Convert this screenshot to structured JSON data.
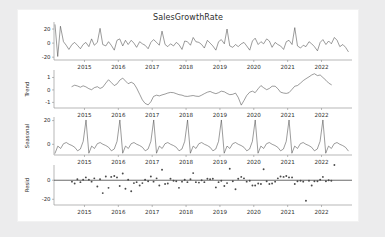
{
  "figure": {
    "title": "SalesGrowthRate",
    "background": "#ffffff",
    "page_background": "#ececed",
    "line_color": "#4a4a4a",
    "axis_color": "#9a9a9a"
  },
  "chart_data": {
    "type": "line",
    "title": "SalesGrowthRate",
    "xlabel": "",
    "x_ticklabels": [
      "2015",
      "2016",
      "2017",
      "2018",
      "2019",
      "2020",
      "2021",
      "2022"
    ],
    "x_tickvalues": [
      2015,
      2016,
      2017,
      2018,
      2019,
      2020,
      2021,
      2022
    ],
    "xlim": [
      2014.1,
      2022.9
    ],
    "grid": false,
    "legend": "none",
    "panels": [
      {
        "name": "observed",
        "ylabel": "",
        "type": "line",
        "ylim": [
          -24,
          30
        ],
        "y_ticklabels": [
          "20",
          "0",
          "-20"
        ],
        "y_tickvalues": [
          20,
          0,
          -20
        ],
        "x": [
          2014.13,
          2014.21,
          2014.29,
          2014.38,
          2014.46,
          2014.54,
          2014.63,
          2014.71,
          2014.79,
          2014.88,
          2014.96,
          2015.04,
          2015.13,
          2015.21,
          2015.29,
          2015.38,
          2015.46,
          2015.54,
          2015.63,
          2015.71,
          2015.79,
          2015.88,
          2015.96,
          2016.04,
          2016.13,
          2016.21,
          2016.29,
          2016.38,
          2016.46,
          2016.54,
          2016.63,
          2016.71,
          2016.79,
          2016.88,
          2016.96,
          2017.04,
          2017.13,
          2017.21,
          2017.29,
          2017.38,
          2017.46,
          2017.54,
          2017.63,
          2017.71,
          2017.79,
          2017.88,
          2017.96,
          2018.04,
          2018.13,
          2018.21,
          2018.29,
          2018.38,
          2018.46,
          2018.54,
          2018.63,
          2018.71,
          2018.79,
          2018.88,
          2018.96,
          2019.04,
          2019.13,
          2019.21,
          2019.29,
          2019.38,
          2019.46,
          2019.54,
          2019.63,
          2019.71,
          2019.79,
          2019.88,
          2019.96,
          2020.04,
          2020.13,
          2020.21,
          2020.29,
          2020.38,
          2020.46,
          2020.54,
          2020.63,
          2020.71,
          2020.79,
          2020.88,
          2020.96,
          2021.04,
          2021.13,
          2021.21,
          2021.29,
          2021.38,
          2021.46,
          2021.54,
          2021.63,
          2021.71,
          2021.79,
          2021.88,
          2021.96,
          2022.04,
          2022.13,
          2022.21,
          2022.29,
          2022.38,
          2022.46,
          2022.54,
          2022.63,
          2022.71,
          2022.79
        ],
        "y": [
          26,
          -19,
          24,
          2,
          -3,
          -9,
          -2,
          1,
          -3,
          -8,
          -2,
          1,
          -5,
          6,
          -3,
          1,
          21,
          -2,
          -4,
          2,
          -3,
          -10,
          4,
          6,
          -4,
          4,
          -2,
          4,
          0,
          -6,
          2,
          -1,
          -3,
          -8,
          1,
          5,
          1,
          -3,
          17,
          -2,
          -5,
          -1,
          -4,
          1,
          -2,
          -9,
          3,
          2,
          -3,
          8,
          2,
          1,
          -2,
          -7,
          4,
          0,
          -4,
          -10,
          2,
          5,
          -1,
          20,
          -4,
          -6,
          -2,
          -5,
          -1,
          1,
          -4,
          -10,
          3,
          7,
          -2,
          2,
          -1,
          6,
          3,
          -6,
          1,
          -2,
          -4,
          -9,
          2,
          4,
          -2,
          22,
          -4,
          -7,
          -3,
          -5,
          2,
          -1,
          -5,
          -11,
          1,
          5,
          -2,
          3,
          -1,
          8,
          4,
          -5,
          -2,
          -6,
          -12
        ]
      },
      {
        "name": "trend",
        "ylabel": "Trend",
        "type": "line",
        "ylim": [
          -1.45,
          1.6
        ],
        "y_ticklabels": [
          "1",
          "0",
          "-1"
        ],
        "y_tickvalues": [
          1,
          0,
          -1
        ],
        "x": [
          2014.63,
          2014.71,
          2014.79,
          2014.88,
          2014.96,
          2015.04,
          2015.13,
          2015.21,
          2015.29,
          2015.38,
          2015.46,
          2015.54,
          2015.63,
          2015.71,
          2015.79,
          2015.88,
          2015.96,
          2016.04,
          2016.13,
          2016.21,
          2016.29,
          2016.38,
          2016.46,
          2016.54,
          2016.63,
          2016.71,
          2016.79,
          2016.88,
          2016.96,
          2017.04,
          2017.13,
          2017.21,
          2017.29,
          2017.38,
          2017.46,
          2017.54,
          2017.63,
          2017.71,
          2017.79,
          2017.88,
          2017.96,
          2018.04,
          2018.13,
          2018.21,
          2018.29,
          2018.38,
          2018.46,
          2018.54,
          2018.63,
          2018.71,
          2018.79,
          2018.88,
          2018.96,
          2019.04,
          2019.13,
          2019.21,
          2019.29,
          2019.38,
          2019.46,
          2019.54,
          2019.63,
          2019.71,
          2019.79,
          2019.88,
          2019.96,
          2020.04,
          2020.13,
          2020.21,
          2020.29,
          2020.38,
          2020.46,
          2020.54,
          2020.63,
          2020.71,
          2020.79,
          2020.88,
          2020.96,
          2021.04,
          2021.13,
          2021.21,
          2021.29,
          2021.38,
          2021.46,
          2021.54,
          2021.63,
          2021.71,
          2021.79,
          2021.88,
          2021.96,
          2022.04,
          2022.13,
          2022.21,
          2022.29,
          2022.38
        ],
        "y": [
          0.27,
          0.38,
          0.32,
          0.22,
          0.33,
          0.25,
          0.1,
          0.02,
          0.18,
          0.26,
          0.12,
          0.22,
          0.55,
          0.82,
          0.6,
          0.35,
          0.48,
          0.78,
          0.95,
          0.72,
          0.5,
          0.62,
          0.5,
          0.15,
          -0.35,
          -0.8,
          -1.08,
          -1.2,
          -0.95,
          -0.52,
          -0.42,
          -0.48,
          -0.4,
          -0.33,
          -0.25,
          -0.2,
          -0.22,
          -0.3,
          -0.38,
          -0.42,
          -0.5,
          -0.52,
          -0.48,
          -0.45,
          -0.5,
          -0.52,
          -0.42,
          -0.3,
          -0.18,
          -0.12,
          -0.22,
          -0.3,
          -0.22,
          -0.1,
          -0.15,
          -0.28,
          -0.38,
          -0.35,
          -0.25,
          -0.6,
          -1.22,
          -0.85,
          -0.45,
          -0.18,
          -0.1,
          -0.22,
          0.1,
          0.35,
          0.18,
          0.02,
          0.12,
          0.3,
          0.3,
          0.1,
          -0.18,
          -0.25,
          -0.28,
          -0.22,
          0.05,
          0.3,
          0.35,
          0.55,
          0.75,
          0.9,
          1.05,
          1.2,
          1.3,
          1.15,
          1.2,
          1.0,
          0.78,
          0.55,
          0.42
        ]
      },
      {
        "name": "seasonal",
        "ylabel": "Seasonal",
        "type": "line",
        "ylim": [
          -9,
          23
        ],
        "y_ticklabels": [
          "20",
          "0"
        ],
        "y_tickvalues": [
          20,
          0
        ],
        "period_months": 12,
        "seasonal_cycle": [
          20.5,
          -7.5,
          -1.5,
          -3.5,
          0.5,
          1.5,
          0.0,
          -1.0,
          -2.5,
          -5.5,
          -4.0,
          2.5
        ],
        "start_month_index": 1,
        "x_start": 2014.13,
        "x_end": 2022.79,
        "n_points": 105
      },
      {
        "name": "resid",
        "ylabel": "Resid",
        "type": "scatter",
        "ylim": [
          -26,
          16
        ],
        "y_ticklabels": [
          "0",
          "-20"
        ],
        "y_tickvalues": [
          0,
          -20
        ],
        "zero_line": 0,
        "x": [
          2014.63,
          2014.71,
          2014.79,
          2014.88,
          2014.96,
          2015.04,
          2015.13,
          2015.21,
          2015.29,
          2015.38,
          2015.46,
          2015.54,
          2015.63,
          2015.71,
          2015.79,
          2015.88,
          2015.96,
          2016.04,
          2016.13,
          2016.21,
          2016.29,
          2016.38,
          2016.46,
          2016.54,
          2016.63,
          2016.71,
          2016.79,
          2016.88,
          2016.96,
          2017.04,
          2017.13,
          2017.21,
          2017.29,
          2017.38,
          2017.46,
          2017.54,
          2017.63,
          2017.71,
          2017.79,
          2017.88,
          2017.96,
          2018.04,
          2018.13,
          2018.21,
          2018.29,
          2018.38,
          2018.46,
          2018.54,
          2018.63,
          2018.71,
          2018.79,
          2018.88,
          2018.96,
          2019.04,
          2019.13,
          2019.21,
          2019.29,
          2019.38,
          2019.46,
          2019.54,
          2019.63,
          2019.71,
          2019.79,
          2019.88,
          2019.96,
          2020.04,
          2020.13,
          2020.21,
          2020.29,
          2020.38,
          2020.46,
          2020.54,
          2020.63,
          2020.71,
          2020.79,
          2020.88,
          2020.96,
          2021.04,
          2021.13,
          2021.21,
          2021.29,
          2021.38,
          2021.46,
          2021.54,
          2021.63,
          2021.71,
          2021.79,
          2021.88,
          2021.96,
          2022.04,
          2022.13,
          2022.21,
          2022.29,
          2022.38
        ],
        "y": [
          -1.5,
          -3.5,
          1.0,
          -2.0,
          0.5,
          3.0,
          0.5,
          -1.5,
          2.0,
          -6.5,
          1.0,
          -13.5,
          4.0,
          -8.0,
          3.5,
          4.5,
          3.0,
          -6.0,
          7.0,
          -9.0,
          0.5,
          -11.5,
          -3.0,
          -2.0,
          -5.5,
          -3.0,
          0.5,
          -1.0,
          4.0,
          -1.5,
          2.0,
          -5.5,
          11.0,
          -4.0,
          -3.5,
          1.5,
          -0.5,
          -1.0,
          -8.0,
          -1.5,
          0.5,
          -2.0,
          1.0,
          7.5,
          -2.0,
          -2.5,
          0.0,
          -2.0,
          1.5,
          1.0,
          1.5,
          -7.5,
          -2.0,
          -0.5,
          -6.0,
          -3.0,
          12.0,
          -1.0,
          -9.5,
          1.5,
          3.5,
          2.0,
          -1.5,
          -0.5,
          -5.5,
          -5.5,
          -3.5,
          -4.0,
          11.5,
          -1.0,
          -4.0,
          -3.5,
          -1.5,
          2.0,
          4.0,
          3.5,
          4.5,
          3.0,
          3.0,
          -4.0,
          -1.0,
          -0.5,
          -1.5,
          -21.5,
          -0.5,
          -5.5,
          -1.0,
          -1.0,
          0.5,
          3.5,
          -1.0,
          0.0,
          -0.5
        ]
      }
    ]
  }
}
